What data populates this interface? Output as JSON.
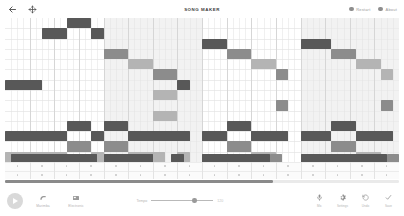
{
  "header": {
    "title": "SONG MAKER",
    "back_icon": "back-arrow-icon",
    "move_icon": "crosshair-move-icon",
    "chips": [
      {
        "label": "Restart",
        "icon": "restart-dot-icon",
        "color": "#8e8e8e"
      },
      {
        "label": "About",
        "icon": "about-dot-icon",
        "color": "#8e8e8e"
      }
    ]
  },
  "grid": {
    "columns": 64,
    "melody_rows": 14,
    "percussion_rows": 2,
    "measures": 4,
    "beats_per_measure": 16,
    "colors": {
      "note_dark": "#585858",
      "note_mid": "#8c8c8c",
      "note_light": "#b4b4b4",
      "measure_band": "#f2f2f2",
      "gridline": "#ececec",
      "background": "#ffffff"
    },
    "notes": [
      {
        "col": 6,
        "row": 1,
        "len": 4,
        "shade": "note_dark"
      },
      {
        "col": 10,
        "row": 0,
        "len": 4,
        "shade": "note_dark"
      },
      {
        "col": 14,
        "row": 1,
        "len": 2,
        "shade": "note_dark"
      },
      {
        "col": 0,
        "row": 6,
        "len": 6,
        "shade": "note_dark"
      },
      {
        "col": 10,
        "row": 10,
        "len": 4,
        "shade": "note_dark"
      },
      {
        "col": 0,
        "row": 11,
        "len": 10,
        "shade": "note_dark"
      },
      {
        "col": 14,
        "row": 11,
        "len": 2,
        "shade": "note_dark"
      },
      {
        "col": 10,
        "row": 12,
        "len": 4,
        "shade": "note_mid"
      },
      {
        "col": 0,
        "row": 13,
        "len": 10,
        "shade": "note_light"
      },
      {
        "col": 14,
        "row": 13,
        "len": 2,
        "shade": "note_light"
      },
      {
        "col": 16,
        "row": 3,
        "len": 4,
        "shade": "note_mid"
      },
      {
        "col": 20,
        "row": 4,
        "len": 4,
        "shade": "note_light"
      },
      {
        "col": 24,
        "row": 5,
        "len": 4,
        "shade": "note_mid"
      },
      {
        "col": 28,
        "row": 6,
        "len": 2,
        "shade": "note_dark"
      },
      {
        "col": 24,
        "row": 7,
        "len": 4,
        "shade": "note_light"
      },
      {
        "col": 24,
        "row": 9,
        "len": 4,
        "shade": "note_light"
      },
      {
        "col": 16,
        "row": 10,
        "len": 4,
        "shade": "note_dark"
      },
      {
        "col": 20,
        "row": 11,
        "len": 10,
        "shade": "note_dark"
      },
      {
        "col": 16,
        "row": 12,
        "len": 4,
        "shade": "note_mid"
      },
      {
        "col": 20,
        "row": 13,
        "len": 6,
        "shade": "note_light"
      },
      {
        "col": 28,
        "row": 13,
        "len": 2,
        "shade": "note_light"
      },
      {
        "col": 32,
        "row": 2,
        "len": 4,
        "shade": "note_dark"
      },
      {
        "col": 36,
        "row": 3,
        "len": 4,
        "shade": "note_mid"
      },
      {
        "col": 40,
        "row": 4,
        "len": 4,
        "shade": "note_light"
      },
      {
        "col": 44,
        "row": 5,
        "len": 2,
        "shade": "note_mid"
      },
      {
        "col": 44,
        "row": 8,
        "len": 2,
        "shade": "note_mid"
      },
      {
        "col": 36,
        "row": 10,
        "len": 4,
        "shade": "note_dark"
      },
      {
        "col": 32,
        "row": 11,
        "len": 4,
        "shade": "note_dark"
      },
      {
        "col": 40,
        "row": 11,
        "len": 6,
        "shade": "note_dark"
      },
      {
        "col": 36,
        "row": 12,
        "len": 4,
        "shade": "note_mid"
      },
      {
        "col": 40,
        "row": 13,
        "len": 4,
        "shade": "note_light"
      },
      {
        "col": 44,
        "row": 14,
        "len": 2,
        "shade": "note_mid"
      },
      {
        "col": 48,
        "row": 2,
        "len": 5,
        "shade": "note_dark"
      },
      {
        "col": 53,
        "row": 3,
        "len": 4,
        "shade": "note_mid"
      },
      {
        "col": 57,
        "row": 4,
        "len": 4,
        "shade": "note_light"
      },
      {
        "col": 61,
        "row": 5,
        "len": 2,
        "shade": "note_light"
      },
      {
        "col": 61,
        "row": 8,
        "len": 2,
        "shade": "note_mid"
      },
      {
        "col": 53,
        "row": 10,
        "len": 4,
        "shade": "note_dark"
      },
      {
        "col": 48,
        "row": 11,
        "len": 5,
        "shade": "note_dark"
      },
      {
        "col": 57,
        "row": 11,
        "len": 6,
        "shade": "note_dark"
      },
      {
        "col": 53,
        "row": 12,
        "len": 4,
        "shade": "note_mid"
      },
      {
        "col": 57,
        "row": 13,
        "len": 4,
        "shade": "note_light"
      },
      {
        "col": 61,
        "row": 14,
        "len": 2,
        "shade": "note_mid"
      }
    ],
    "percussion": [
      {
        "col": 1,
        "row": 0,
        "len": 14,
        "shade": "note_dark"
      },
      {
        "col": 16,
        "row": 0,
        "len": 8,
        "shade": "note_dark"
      },
      {
        "col": 24,
        "row": 0,
        "len": 2,
        "shade": "note_light"
      },
      {
        "col": 27,
        "row": 0,
        "len": 2,
        "shade": "note_dark"
      },
      {
        "col": 32,
        "row": 0,
        "len": 11,
        "shade": "note_dark"
      },
      {
        "col": 43,
        "row": 0,
        "len": 2,
        "shade": "note_mid"
      },
      {
        "col": 48,
        "row": 0,
        "len": 14,
        "shade": "note_dark"
      },
      {
        "col": 62,
        "row": 0,
        "len": 2,
        "shade": "note_mid"
      }
    ]
  },
  "progress": {
    "percent": 68
  },
  "toolbar": {
    "play_label": "play-button",
    "instruments": [
      {
        "label": "Marimba",
        "icon": "marimba-icon"
      },
      {
        "label": "Electronic",
        "icon": "electronic-icon"
      }
    ],
    "tempo": {
      "label": "Tempo",
      "value": "120",
      "percent": 70
    },
    "right_tools": [
      {
        "label": "Mic",
        "icon": "microphone-icon"
      },
      {
        "label": "Settings",
        "icon": "gear-icon"
      },
      {
        "label": "Undo",
        "icon": "undo-icon"
      },
      {
        "label": "Save",
        "icon": "check-icon"
      }
    ]
  }
}
